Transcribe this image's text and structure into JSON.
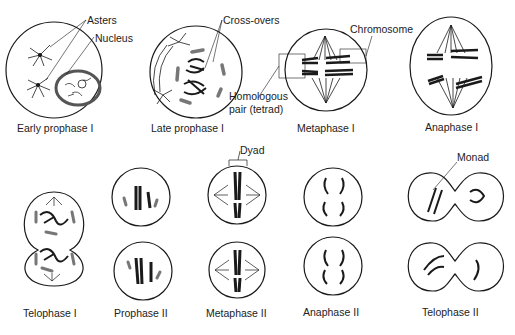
{
  "figure": {
    "captions": {
      "early_prophase_1": "Early prophase I",
      "late_prophase_1": "Late prophase I",
      "metaphase_1": "Metaphase I",
      "anaphase_1": "Anaphase I",
      "telophase_1": "Telophase I",
      "prophase_2": "Prophase II",
      "metaphase_2": "Metaphase II",
      "anaphase_2": "Anaphase II",
      "telophase_2": "Telophase II"
    },
    "annotations": {
      "asters": "Asters",
      "nucleus": "Nucleus",
      "cross_overs": "Cross-overs",
      "chromosome": "Chromosome",
      "homologous_line1": "Homologous",
      "homologous_line2": "pair (tetrad)",
      "dyad": "Dyad",
      "monad": "Monad"
    }
  }
}
